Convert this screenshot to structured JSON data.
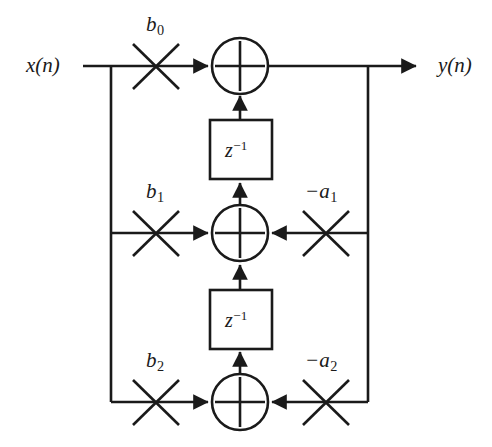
{
  "diagram": {
    "type": "signal-flow-graph",
    "background_color": "#ffffff",
    "line_color": "#1a1a1a",
    "text_color": "#1a1a1a",
    "input": {
      "name": "x",
      "index": "(n)",
      "label": "x(n)"
    },
    "output": {
      "name": "y",
      "index": "(n)",
      "label": "y(n)"
    },
    "feedforward_coefficients": [
      {
        "id": "b0",
        "base": "b",
        "sub": "0",
        "label": "b0"
      },
      {
        "id": "b1",
        "base": "b",
        "sub": "1",
        "label": "b1"
      },
      {
        "id": "b2",
        "base": "b",
        "sub": "2",
        "label": "b2"
      }
    ],
    "feedback_coefficients": [
      {
        "id": "a1",
        "base": "−a",
        "sub": "1",
        "label": "-a1"
      },
      {
        "id": "a2",
        "base": "−a",
        "sub": "2",
        "label": "-a2"
      }
    ],
    "delay_elements": [
      {
        "id": "delay-1",
        "base": "z",
        "sup": "−1",
        "label": "z^-1"
      },
      {
        "id": "delay-2",
        "base": "z",
        "sup": "−1",
        "label": "z^-1"
      }
    ],
    "adders": [
      {
        "id": "adder-top",
        "symbol": "+"
      },
      {
        "id": "adder-middle",
        "symbol": "+"
      },
      {
        "id": "adder-bottom",
        "symbol": "+"
      }
    ]
  }
}
